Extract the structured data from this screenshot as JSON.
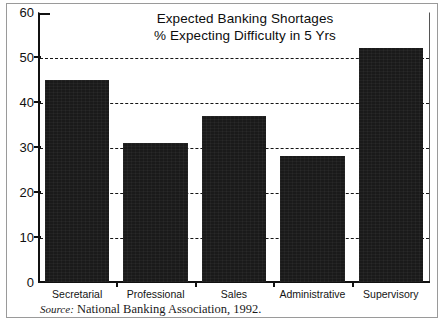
{
  "figure": {
    "title_line1": "Expected Banking Shortages",
    "title_line2": "% Expecting Difficulty in 5 Yrs",
    "source_label": "Source:",
    "source_text": "National Banking Association, 1992.",
    "bar_color": "#1a1a1a",
    "axis_color": "#111111",
    "background": "#ffffff"
  },
  "chart_data": {
    "type": "bar",
    "title": "Expected Banking Shortages\n% Expecting Difficulty in 5 Yrs",
    "categories": [
      "Secretarial",
      "Professional",
      "Sales",
      "Administrative",
      "Supervisory"
    ],
    "values": [
      45,
      31,
      37,
      28,
      52
    ],
    "xlabel": "",
    "ylabel": "",
    "ylim": [
      0,
      60
    ],
    "yticks": [
      0,
      10,
      20,
      30,
      40,
      50,
      60
    ],
    "ytick_labels": [
      "0",
      "10",
      "20",
      "30",
      "40",
      "50",
      "60"
    ],
    "gridlines": [
      10,
      20,
      30,
      40,
      50
    ],
    "grid": true,
    "grid_style": "dashed",
    "legend": null,
    "legend_position": "none",
    "series": [
      {
        "name": "% Expecting Difficulty in 5 Yrs",
        "values": [
          45,
          31,
          37,
          28,
          52
        ]
      }
    ],
    "annotations": [
      "Source: National Banking Association, 1992."
    ]
  }
}
